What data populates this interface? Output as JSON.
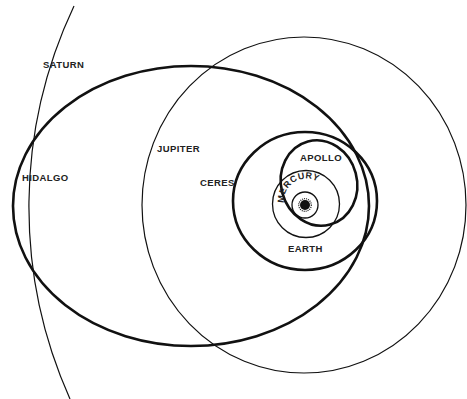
{
  "figure": {
    "type": "orbit-diagram",
    "caption_visible": "clipped at bottom edge; illegible"
  },
  "labels": {
    "saturn": "SATURN",
    "hidalgo": "HIDALGO",
    "jupiter": "JUPITER",
    "ceres": "CERES",
    "apollo": "APOLLO",
    "mercury": "MERCURY",
    "earth": "EARTH"
  },
  "colors": {
    "line": "#111111",
    "background": "#ffffff",
    "label": "#222222"
  },
  "orbits": [
    {
      "name": "sun",
      "cx": 305,
      "cy": 205,
      "r": 5
    },
    {
      "name": "mercury",
      "cx": 305,
      "cy": 205,
      "rx": 13,
      "ry": 13,
      "weight": "thin"
    },
    {
      "name": "earth",
      "cx": 306,
      "cy": 204,
      "rx": 33,
      "ry": 34,
      "weight": "thin"
    },
    {
      "name": "apollo",
      "cx": 319,
      "cy": 183,
      "rx": 38,
      "ry": 43,
      "weight": "thick"
    },
    {
      "name": "ceres",
      "cx": 305,
      "cy": 201,
      "rx": 72,
      "ry": 69,
      "weight": "thick"
    },
    {
      "name": "hidalgo",
      "cx": 191,
      "cy": 206,
      "rx": 178,
      "ry": 140,
      "weight": "thick"
    },
    {
      "name": "jupiter",
      "cx": 304,
      "cy": 205,
      "rx": 162,
      "ry": 168,
      "weight": "thin"
    },
    {
      "name": "saturn",
      "cx": 470,
      "cy": 205,
      "r": 465,
      "weight": "thin",
      "partial": true
    }
  ]
}
